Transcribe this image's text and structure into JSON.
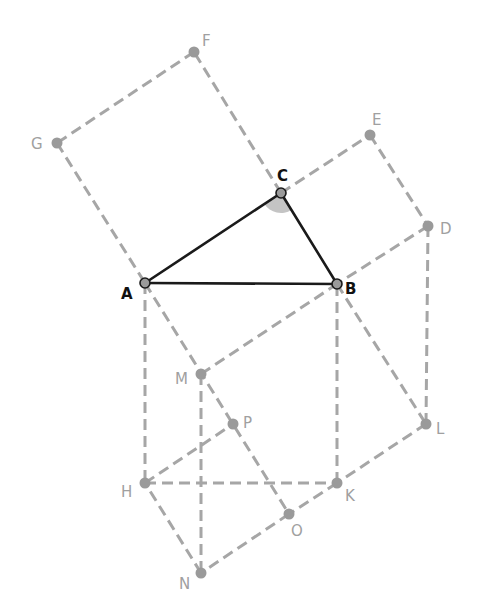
{
  "diagram": {
    "main_points": [
      "A",
      "B",
      "C"
    ],
    "points": {
      "A": {
        "label": "A",
        "role": "triangle-vertex"
      },
      "B": {
        "label": "B",
        "role": "triangle-vertex"
      },
      "C": {
        "label": "C",
        "role": "triangle-vertex"
      },
      "D": {
        "label": "D",
        "role": "construction"
      },
      "E": {
        "label": "E",
        "role": "construction"
      },
      "F": {
        "label": "F",
        "role": "construction"
      },
      "G": {
        "label": "G",
        "role": "construction"
      },
      "H": {
        "label": "H",
        "role": "construction"
      },
      "K": {
        "label": "K",
        "role": "construction"
      },
      "L": {
        "label": "L",
        "role": "construction"
      },
      "M": {
        "label": "M",
        "role": "construction"
      },
      "N": {
        "label": "N",
        "role": "construction"
      },
      "O": {
        "label": "O",
        "role": "construction"
      },
      "P": {
        "label": "P",
        "role": "construction"
      }
    },
    "solid_segments": [
      [
        "A",
        "B"
      ],
      [
        "B",
        "C"
      ],
      [
        "C",
        "A"
      ]
    ],
    "dashed_segments": [
      [
        "C",
        "F"
      ],
      [
        "F",
        "G"
      ],
      [
        "G",
        "A"
      ],
      [
        "C",
        "E"
      ],
      [
        "E",
        "D"
      ],
      [
        "D",
        "B"
      ],
      [
        "A",
        "H"
      ],
      [
        "H",
        "K"
      ],
      [
        "K",
        "B"
      ],
      [
        "D",
        "L"
      ],
      [
        "B",
        "L"
      ],
      [
        "L",
        "K"
      ],
      [
        "K",
        "O"
      ],
      [
        "O",
        "N"
      ],
      [
        "N",
        "H"
      ],
      [
        "A",
        "O"
      ],
      [
        "M",
        "B"
      ],
      [
        "M",
        "N"
      ],
      [
        "H",
        "P"
      ]
    ],
    "angle_marker": {
      "vertex": "C",
      "between": [
        "A",
        "B"
      ]
    },
    "colors": {
      "solid_line": "#1a1a1a",
      "dashed_line": "#a6a6a6",
      "point_fill": "#9a9a9a",
      "main_label": "#111111",
      "construction_label": "#a0a0a0",
      "angle_fill": "#c4c4c4"
    }
  }
}
